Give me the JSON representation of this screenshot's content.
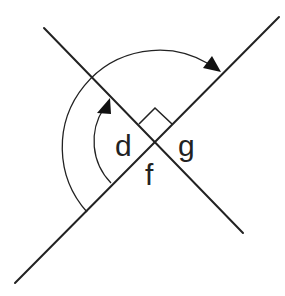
{
  "diagram": {
    "labels": {
      "d": "d",
      "f": "f",
      "g": "g"
    },
    "colors": {
      "stroke": "#222222",
      "background": "#ffffff"
    },
    "lines": [
      {
        "name": "line-a",
        "x1": 15,
        "y1": 283,
        "x2": 279,
        "y2": 17
      },
      {
        "name": "line-b",
        "x1": 44,
        "y1": 28,
        "x2": 243,
        "y2": 233
      }
    ],
    "intersection": {
      "x": 155,
      "y": 141
    },
    "right_angle_marker": true,
    "arcs": [
      {
        "name": "inner-arc",
        "radius": 60,
        "arrow": true
      },
      {
        "name": "outer-arc",
        "radius": 97,
        "arrow": true
      }
    ]
  }
}
